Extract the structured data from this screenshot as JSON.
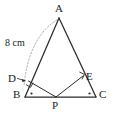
{
  "figure": {
    "width": 114,
    "height": 117,
    "background_color": "#ffffff",
    "stroke_color": "#2b2b2b",
    "dotted_color": "#9a9a9a",
    "text_color": "#1a1a1a"
  },
  "labels": {
    "apex": "A",
    "left_base": "B",
    "right_base": "C",
    "base_point": "P",
    "foot_on_ab": "D",
    "foot_on_ac": "E"
  },
  "measurements": {
    "side_ab": "8 cm"
  },
  "points": {
    "A": {
      "x": 59,
      "y": 18
    },
    "B": {
      "x": 25,
      "y": 97
    },
    "C": {
      "x": 96,
      "y": 97
    },
    "P": {
      "x": 56,
      "y": 97
    },
    "D": {
      "x": 28.5,
      "y": 81
    },
    "E": {
      "x": 83,
      "y": 76
    }
  },
  "label_positions": {
    "A": {
      "x": 55,
      "y": 3
    },
    "B": {
      "x": 13,
      "y": 89
    },
    "C": {
      "x": 99,
      "y": 89
    },
    "P": {
      "x": 52,
      "y": 100
    },
    "D": {
      "x": 8,
      "y": 73
    },
    "E": {
      "x": 86,
      "y": 71
    },
    "side_ab": {
      "x": 5,
      "y": 38
    }
  },
  "marks": {
    "right_angle_at_D": true,
    "right_angle_at_E": true,
    "angle_dot_at_B": true,
    "angle_dot_at_C": true,
    "arrow_from_D_label": true,
    "dotted_arc_A_to_D": true
  },
  "segments": [
    {
      "name": "AB",
      "from": "A",
      "to": "B",
      "style": "solid"
    },
    {
      "name": "AC",
      "from": "A",
      "to": "C",
      "style": "solid"
    },
    {
      "name": "BC",
      "from": "B",
      "to": "C",
      "style": "solid"
    },
    {
      "name": "PD",
      "from": "P",
      "to": "D",
      "style": "solid"
    },
    {
      "name": "PE",
      "from": "P",
      "to": "E",
      "style": "solid"
    }
  ]
}
